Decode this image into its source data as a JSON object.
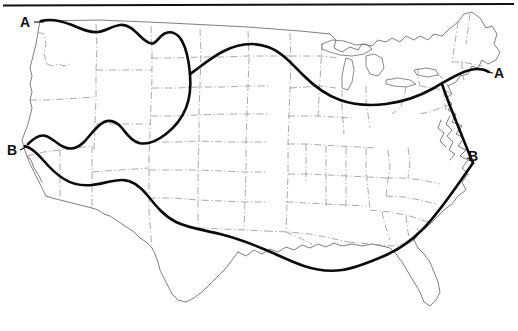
{
  "figure": {
    "kind": "map",
    "region": "contiguous-united-states",
    "background_color": "#ffffff",
    "top_rule": {
      "present": true,
      "color": "#111111",
      "thickness_px": 2
    },
    "basemap": {
      "coastline_color": "#5e5e5e",
      "state_border_color": "#8d8d8d",
      "state_border_style": "dash-dot",
      "lakes_shown": true
    },
    "curves": [
      {
        "id": "A",
        "label": "A",
        "color": "#0b0b0b",
        "width_px": 2.6,
        "description": "northern boundary line running from Pacific Northwest coast east across the northern states to the New England coast",
        "endpoints": [
          "west",
          "east"
        ]
      },
      {
        "id": "B",
        "label": "B",
        "color": "#0b0b0b",
        "width_px": 2.6,
        "description": "southern boundary line running from the northern California coast south-east across the Southwest and Gulf coast, then up the Atlantic seaboard",
        "endpoints": [
          "west",
          "east"
        ]
      }
    ],
    "labels": [
      {
        "id": "label-a-west",
        "text": "A",
        "x": 30,
        "y": 27,
        "curve": "A",
        "side": "west"
      },
      {
        "id": "label-a-east",
        "text": "A",
        "x": 494,
        "y": 78,
        "curve": "A",
        "side": "east"
      },
      {
        "id": "label-b-west",
        "text": "B",
        "x": 7,
        "y": 155,
        "curve": "B",
        "side": "west"
      },
      {
        "id": "label-b-east",
        "text": "B",
        "x": 468,
        "y": 161,
        "curve": "B",
        "side": "east"
      }
    ]
  }
}
